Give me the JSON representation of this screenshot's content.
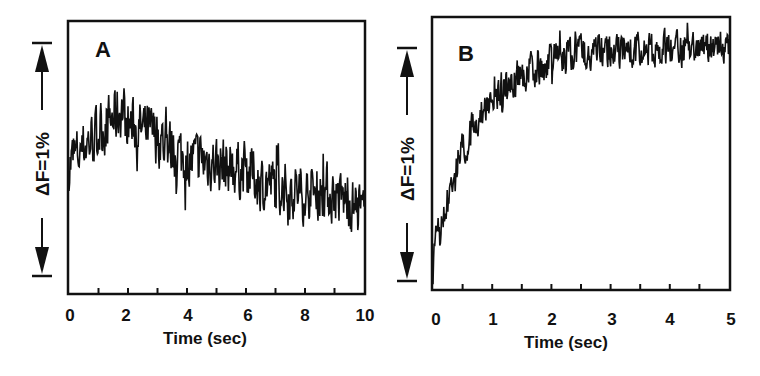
{
  "chart_data": [
    {
      "type": "line",
      "panel": "A",
      "title": "",
      "xlabel": "Time (sec)",
      "ylabel": "ΔF=1%",
      "xlim": [
        0,
        10
      ],
      "x_ticks": [
        0,
        2,
        4,
        6,
        8,
        10
      ],
      "x_minor_ticks": [
        1,
        3,
        5,
        7,
        9
      ],
      "grid": false,
      "legend": null,
      "scale_bar": {
        "label": "ΔF=1%",
        "span_percent": 1
      },
      "ylim_percent": [
        -0.55,
        0.62
      ],
      "series": [
        {
          "name": "fluorescence trace",
          "x": [
            0,
            0.5,
            1.0,
            1.5,
            1.8,
            2.0,
            2.5,
            3.0,
            3.5,
            4.0,
            4.5,
            5.0,
            5.5,
            6.0,
            6.5,
            7.0,
            7.5,
            8.0,
            8.5,
            9.0,
            9.5,
            10.0
          ],
          "values": [
            0.0,
            0.08,
            0.14,
            0.2,
            0.24,
            0.18,
            0.15,
            0.12,
            0.07,
            0.03,
            0.02,
            0.01,
            -0.01,
            -0.02,
            -0.07,
            -0.09,
            -0.11,
            -0.12,
            -0.11,
            -0.13,
            -0.16,
            -0.22
          ],
          "noise_amplitude_percent": 0.08
        }
      ]
    },
    {
      "type": "line",
      "panel": "B",
      "title": "",
      "xlabel": "Time (sec)",
      "ylabel": "ΔF=1%",
      "xlim": [
        0,
        5
      ],
      "x_ticks": [
        0,
        1,
        2,
        3,
        4,
        5
      ],
      "x_minor_ticks": [
        0.5,
        1.5,
        2.5,
        3.5,
        4.5
      ],
      "grid": false,
      "legend": null,
      "scale_bar": {
        "label": "ΔF=1%",
        "span_percent": 1
      },
      "ylim_percent": [
        -0.07,
        1.1
      ],
      "series": [
        {
          "name": "fluorescence trace",
          "x": [
            0,
            0.05,
            0.25,
            0.5,
            0.75,
            1.0,
            1.25,
            1.5,
            1.75,
            2.0,
            2.5,
            3.0,
            3.5,
            4.0,
            4.5,
            5.0
          ],
          "values": [
            0.02,
            0.12,
            0.3,
            0.52,
            0.66,
            0.75,
            0.81,
            0.85,
            0.88,
            0.91,
            0.95,
            0.96,
            0.95,
            0.96,
            0.96,
            0.97
          ],
          "noise_amplitude_percent": 0.05
        }
      ]
    }
  ],
  "panels": {
    "a": {
      "letter": "A",
      "x_tick_labels": [
        "0",
        "2",
        "4",
        "6",
        "8",
        "10"
      ],
      "xlabel": "Time (sec)",
      "scale_label": "ΔF=1%"
    },
    "b": {
      "letter": "B",
      "x_tick_labels": [
        "0",
        "1",
        "2",
        "3",
        "4",
        "5"
      ],
      "xlabel": "Time (sec)",
      "scale_label": "ΔF=1%"
    }
  },
  "colors": {
    "trace": "#111111",
    "axes": "#111111",
    "background": "#ffffff"
  }
}
